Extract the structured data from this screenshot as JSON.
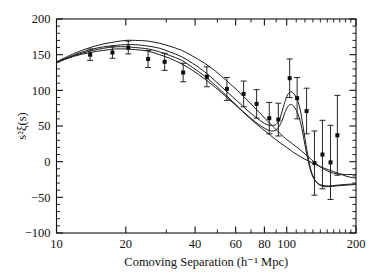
{
  "figure": {
    "background_color": "#ffffff",
    "ink_color": "#111111"
  },
  "chart_data": {
    "type": "scatter",
    "title": "",
    "subtitle": "",
    "xlabel": "Comoving Separation (h⁻¹ Mpc)",
    "ylabel": "s²ξ(s)",
    "xscale": "log",
    "yscale": "linear",
    "xlim": [
      10,
      200
    ],
    "ylim": [
      -100,
      200
    ],
    "grid": false,
    "legend": "none",
    "xticks_major": [
      10,
      20,
      40,
      60,
      80,
      100,
      200
    ],
    "xtick_labels": [
      "10",
      "20",
      "40",
      "60",
      "80",
      "100",
      "200"
    ],
    "xticks_minor": [
      30,
      50,
      70,
      90,
      110,
      120,
      130,
      140,
      150,
      160,
      170,
      180,
      190
    ],
    "yticks_major": [
      200,
      150,
      100,
      50,
      0,
      -50,
      -100
    ],
    "ytick_labels": [
      "200",
      "150",
      "100",
      "50",
      "0",
      "−50",
      "−100"
    ],
    "ytick_minor_step": 10,
    "points": {
      "name": "SDSS LRG correlation function",
      "marker": "filled-square",
      "x": [
        14,
        17.5,
        20.5,
        25,
        29.5,
        35.5,
        45,
        55,
        65,
        74,
        84,
        92,
        103,
        111,
        122,
        132,
        143,
        155,
        166
      ],
      "y": [
        150,
        153,
        160,
        144,
        140,
        125,
        119,
        102,
        95,
        81,
        61,
        59,
        117,
        89,
        71,
        -2,
        10,
        -1,
        37
      ],
      "yerr_lower": [
        8,
        8,
        9,
        12,
        12,
        13,
        14,
        16,
        18,
        20,
        22,
        23,
        27,
        29,
        32,
        45,
        48,
        52,
        56
      ],
      "yerr_upper": [
        8,
        8,
        9,
        12,
        12,
        13,
        14,
        16,
        18,
        20,
        22,
        23,
        27,
        29,
        32,
        45,
        48,
        52,
        56
      ],
      "last_point_y": 2
    },
    "series": [
      {
        "name": "model-omh2-0.12",
        "style": "solid",
        "x": [
          10,
          12,
          14,
          16,
          18,
          20,
          22,
          25,
          28,
          31,
          35,
          39,
          44,
          49,
          55,
          61,
          68,
          75,
          82,
          88,
          94,
          99,
          103,
          106,
          109,
          112,
          116,
          120,
          125,
          131,
          138,
          146,
          155,
          165,
          178,
          190,
          200
        ],
        "y": [
          140,
          152,
          160,
          165,
          168,
          170,
          170,
          169,
          166,
          162,
          156,
          148,
          138,
          127,
          113,
          100,
          85,
          71,
          58,
          48,
          39,
          32,
          28,
          25,
          22,
          19,
          15,
          11,
          6,
          0,
          -6,
          -11,
          -15,
          -17,
          -18,
          -18,
          -18
        ]
      },
      {
        "name": "model-omh2-0.13",
        "style": "solid",
        "x": [
          10,
          12,
          14,
          16,
          18,
          20,
          22,
          25,
          28,
          31,
          35,
          39,
          44,
          49,
          55,
          61,
          68,
          75,
          82,
          88,
          92,
          95,
          98,
          101,
          104,
          107,
          110,
          113,
          116,
          119,
          123,
          128,
          134,
          142,
          152,
          165,
          180,
          200
        ],
        "y": [
          139,
          150,
          157,
          161,
          163,
          164,
          164,
          162,
          159,
          154,
          147,
          138,
          126,
          113,
          98,
          85,
          71,
          60,
          52,
          51,
          56,
          68,
          83,
          94,
          98,
          96,
          90,
          80,
          63,
          40,
          12,
          -14,
          -28,
          -34,
          -35,
          -34,
          -33,
          -32
        ]
      },
      {
        "name": "model-omh2-0.14",
        "style": "solid",
        "x": [
          10,
          12,
          14,
          16,
          18,
          20,
          22,
          25,
          28,
          31,
          35,
          39,
          44,
          49,
          55,
          61,
          68,
          75,
          82,
          87,
          91,
          95,
          98,
          101,
          104,
          107,
          110,
          113,
          116,
          119,
          123,
          128,
          134,
          142,
          152,
          165,
          180,
          200
        ],
        "y": [
          139,
          149,
          155,
          159,
          161,
          161,
          160,
          158,
          154,
          149,
          142,
          132,
          120,
          107,
          92,
          78,
          64,
          53,
          45,
          43,
          46,
          56,
          68,
          77,
          80,
          78,
          72,
          63,
          49,
          30,
          6,
          -16,
          -28,
          -33,
          -34,
          -33,
          -32,
          -31
        ]
      },
      {
        "name": "model-zero-baryon",
        "style": "solid",
        "x": [
          10,
          12,
          14,
          16,
          18,
          20,
          22,
          25,
          28,
          31,
          35,
          39,
          44,
          49,
          55,
          61,
          68,
          75,
          82,
          88,
          94,
          100,
          106,
          112,
          119,
          126,
          134,
          142,
          151,
          160,
          170,
          180,
          190,
          200
        ],
        "y": [
          139,
          148,
          153,
          156,
          158,
          158,
          157,
          155,
          150,
          145,
          137,
          128,
          116,
          104,
          90,
          77,
          63,
          51,
          41,
          33,
          26,
          20,
          14,
          9,
          4,
          0,
          -4,
          -8,
          -11,
          -14,
          -17,
          -20,
          -22,
          -23
        ]
      }
    ]
  }
}
